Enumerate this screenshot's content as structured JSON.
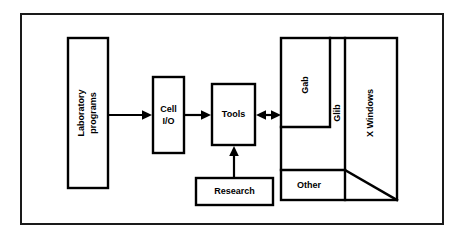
{
  "diagram": {
    "background_color": "#ffffff",
    "frame": {
      "label": "outer-frame",
      "border_color": "#1a1a1a"
    },
    "nodes": {
      "laboratory_programs": {
        "line1": "Laboratory",
        "line2": "programs",
        "orientation": "vertical"
      },
      "cell_io": {
        "line1": "Cell",
        "line2": "I/O",
        "orientation": "horizontal"
      },
      "tools": {
        "label": "Tools",
        "orientation": "horizontal"
      },
      "research": {
        "label": "Research",
        "orientation": "horizontal"
      },
      "gab": {
        "label": "Gab",
        "orientation": "vertical"
      },
      "glib": {
        "label": "Glib",
        "orientation": "vertical"
      },
      "x_windows": {
        "label": "X Windows",
        "orientation": "vertical"
      },
      "other": {
        "label": "Other",
        "orientation": "horizontal"
      }
    },
    "connectors": {
      "lab_to_cellio": {
        "label": "arrow-lab-to-cellio",
        "direction": "right"
      },
      "cellio_to_tools": {
        "label": "arrow-cellio-to-tools",
        "direction": "right"
      },
      "tools_to_graphics": {
        "label": "arrow-tools-to-graphics",
        "direction": "bidirectional"
      },
      "research_to_tools": {
        "label": "arrow-research-to-tools",
        "direction": "up"
      }
    },
    "colors": {
      "stroke": "#000000",
      "frame_stroke": "#1a1a1a",
      "fill": "#ffffff"
    }
  }
}
